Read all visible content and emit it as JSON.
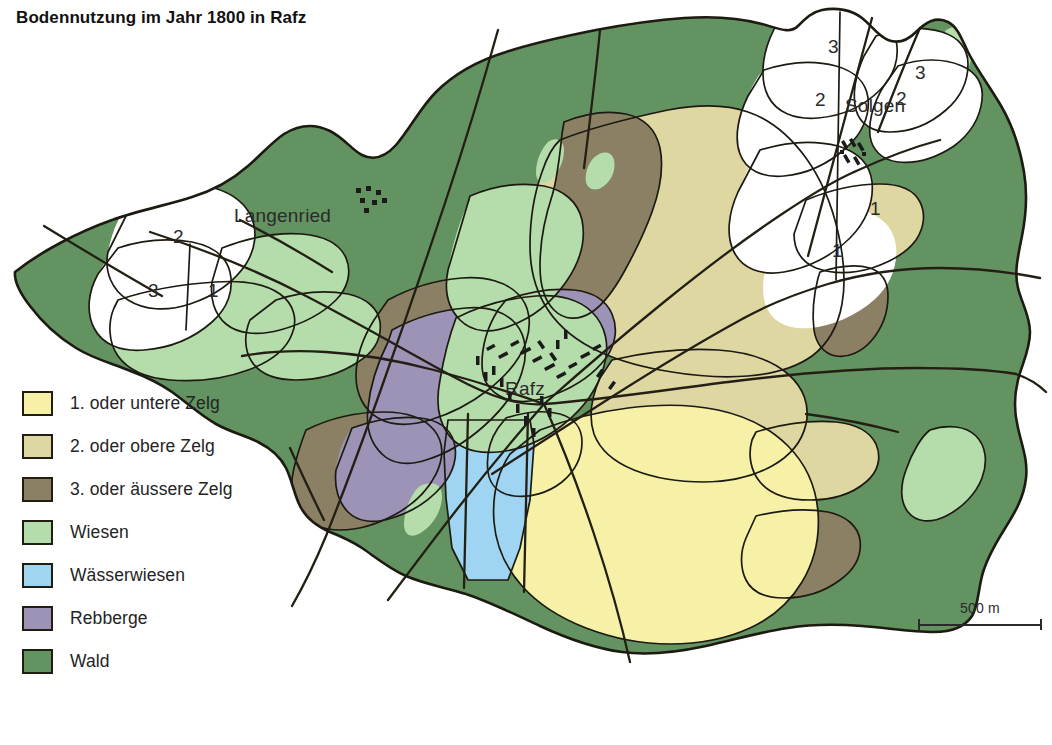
{
  "title": "Bodennutzung im Jahr 1800 in Rafz",
  "legend": {
    "items": [
      {
        "label": "1. oder untere Zelg",
        "color": "#f6f1a6",
        "key": "zelg1"
      },
      {
        "label": "2. oder obere Zelg",
        "color": "#ded7a2",
        "key": "zelg2"
      },
      {
        "label": "3. oder äussere Zelg",
        "color": "#8b8064",
        "key": "zelg3"
      },
      {
        "label": "Wiesen",
        "color": "#b5dcab",
        "key": "wiesen"
      },
      {
        "label": "Wässerwiesen",
        "color": "#9fd4f2",
        "key": "waesserwiesen"
      },
      {
        "label": "Rebberge",
        "color": "#9c93b6",
        "key": "rebberge"
      },
      {
        "label": "Wald",
        "color": "#629360",
        "key": "wald"
      }
    ]
  },
  "scalebar": {
    "label": "500 m"
  },
  "map": {
    "places": [
      {
        "name": "Langenried",
        "x": 234,
        "y": 215
      },
      {
        "name": "Solgen",
        "x": 845,
        "y": 105
      },
      {
        "name": "Rafz",
        "x": 505,
        "y": 388
      }
    ],
    "zelg_numbers": [
      {
        "value": "2",
        "x": 173,
        "y": 226
      },
      {
        "value": "3",
        "x": 148,
        "y": 280
      },
      {
        "value": "1",
        "x": 208,
        "y": 280
      },
      {
        "value": "3",
        "x": 828,
        "y": 36
      },
      {
        "value": "2",
        "x": 815,
        "y": 89
      },
      {
        "value": "3",
        "x": 915,
        "y": 62
      },
      {
        "value": "2",
        "x": 896,
        "y": 88
      },
      {
        "value": "1",
        "x": 870,
        "y": 198
      },
      {
        "value": "1",
        "x": 832,
        "y": 240
      }
    ],
    "colors": {
      "zelg1": "#f6f1a6",
      "zelg2": "#ded7a2",
      "zelg3": "#8b8064",
      "wiesen": "#b5dcab",
      "waesserwiesen": "#9fd4f2",
      "rebberge": "#9c93b6",
      "wald": "#629360",
      "unfarmed": "#ffffff",
      "outline": "#1d1a12",
      "road": "#231f14",
      "building": "#1a1a1a"
    }
  }
}
